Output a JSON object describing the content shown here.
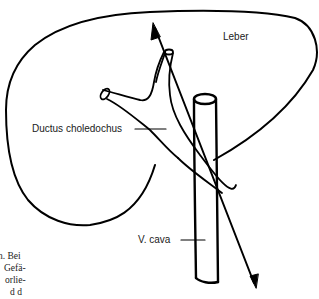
{
  "diagram": {
    "labels": {
      "liver": "Leber",
      "bile_duct": "Ductus choledochus",
      "vena_cava": "V. cava"
    },
    "side_text_fragments": [
      "n. Bei",
      "Gefä-",
      "orlie-",
      "d d"
    ],
    "colors": {
      "stroke": "#000000",
      "background": "#ffffff",
      "text": "#1a1a1a"
    }
  }
}
